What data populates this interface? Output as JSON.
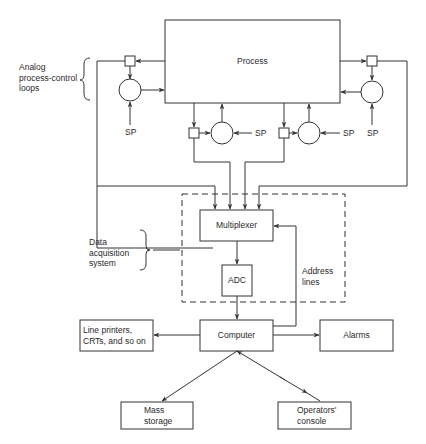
{
  "diagram": {
    "type": "block-diagram",
    "colors": {
      "line": "#333333",
      "background": "#ffffff",
      "text": "#2a2a2a"
    }
  },
  "blocks": {
    "process": "Process",
    "multiplexer": "Multiplexer",
    "adc": "ADC",
    "computer": "Computer",
    "line_printers": [
      "Line printers,",
      "CRTs, and so on"
    ],
    "alarms": "Alarms",
    "mass_storage": [
      "Mass",
      "storage"
    ],
    "operators_console": [
      "Operators'",
      "console"
    ]
  },
  "annotations": {
    "analog_loops": [
      "Analog",
      "process-control",
      "loops"
    ],
    "data_acquisition": [
      "Data",
      "acquisition",
      "system"
    ],
    "address_lines": [
      "Address",
      "lines"
    ],
    "setpoint": "SP"
  },
  "connections": [
    {
      "from": "Process",
      "to": "Left outer loop sensor"
    },
    {
      "from": "Left outer loop controller",
      "to": "Process"
    },
    {
      "from": "Process",
      "to": "Right outer loop sensor"
    },
    {
      "from": "Right outer loop controller",
      "to": "Process"
    },
    {
      "from": "Process",
      "to": "Inner left loop sensor"
    },
    {
      "from": "Inner left loop controller",
      "to": "Process"
    },
    {
      "from": "Process",
      "to": "Inner right loop sensor"
    },
    {
      "from": "Inner right loop controller",
      "to": "Process"
    },
    {
      "from": "Loop signals (4)",
      "to": "Multiplexer"
    },
    {
      "from": "Multiplexer",
      "to": "ADC"
    },
    {
      "from": "ADC",
      "to": "Computer"
    },
    {
      "from": "Computer",
      "to": "Multiplexer",
      "label": "Address lines"
    },
    {
      "from": "Computer",
      "to": "Line printers, CRTs, and so on"
    },
    {
      "from": "Computer",
      "to": "Alarms"
    },
    {
      "from": "Computer",
      "to": "Mass storage"
    },
    {
      "from": "Computer",
      "to": "Operators' console",
      "bidirectional": true
    }
  ]
}
